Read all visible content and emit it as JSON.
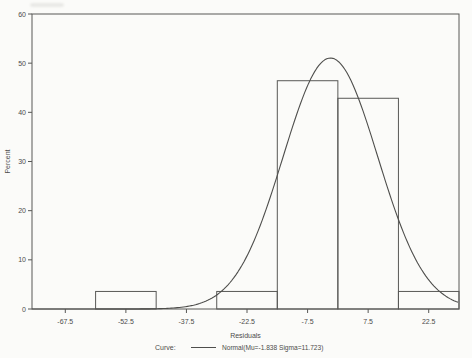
{
  "window": {
    "background": "#fbfbf9"
  },
  "chart_data": {
    "type": "bar",
    "subtype": "histogram-with-normal-curve",
    "title": "",
    "xlabel": "Residuals",
    "ylabel": "Percent",
    "xlim": [
      -75.75,
      30
    ],
    "ylim": [
      0,
      60
    ],
    "x_ticks": [
      -67.5,
      -52.5,
      -37.5,
      -22.5,
      -7.5,
      7.5,
      22.5
    ],
    "y_ticks": [
      0,
      10,
      20,
      30,
      40,
      50,
      60
    ],
    "grid": false,
    "legend_position": "bottom",
    "bin_width": 15,
    "bars": [
      {
        "center": -52.5,
        "left": -60,
        "right": -45,
        "percent": 3.57
      },
      {
        "center": -22.5,
        "left": -30,
        "right": -15,
        "percent": 3.57
      },
      {
        "center": -7.5,
        "left": -15,
        "right": 0,
        "percent": 46.43
      },
      {
        "center": 7.5,
        "left": 0,
        "right": 15,
        "percent": 42.86
      },
      {
        "center": 22.5,
        "left": 15,
        "right": 30,
        "percent": 3.57
      }
    ],
    "curve": {
      "kind": "normal",
      "mu": -1.838,
      "sigma": 11.723,
      "peak_percent": 51.0
    },
    "legend": {
      "label": "Curve:",
      "entry": "Normal(Mu=-1.838 Sigma=11.723)"
    },
    "colors": {
      "line": "#585856",
      "curve": "#4e4e4c",
      "text": "#4c4c4a"
    }
  }
}
